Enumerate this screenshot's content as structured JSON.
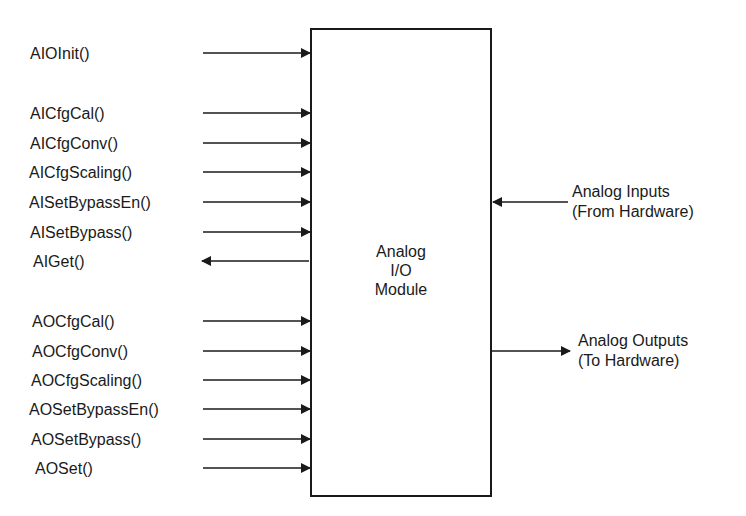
{
  "diagram": {
    "module": {
      "lines": [
        "Analog",
        "I/O",
        "Module"
      ]
    },
    "left_functions": [
      {
        "label": "AIOInit()",
        "direction": "in"
      },
      {
        "label": "AICfgCal()",
        "direction": "in"
      },
      {
        "label": "AICfgConv()",
        "direction": "in"
      },
      {
        "label": "AICfgScaling()",
        "direction": "in"
      },
      {
        "label": "AISetBypassEn()",
        "direction": "in"
      },
      {
        "label": "AISetBypass()",
        "direction": "in"
      },
      {
        "label": "AIGet()",
        "direction": "out"
      },
      {
        "label": "AOCfgCal()",
        "direction": "in"
      },
      {
        "label": "AOCfgConv()",
        "direction": "in"
      },
      {
        "label": "AOCfgScaling()",
        "direction": "in"
      },
      {
        "label": "AOSetBypassEn()",
        "direction": "in"
      },
      {
        "label": "AOSetBypass()",
        "direction": "in"
      },
      {
        "label": "AOSet()",
        "direction": "in"
      }
    ],
    "right_signals": [
      {
        "lines": [
          "Analog Inputs",
          "(From Hardware)"
        ],
        "direction": "in"
      },
      {
        "lines": [
          "Analog Outputs",
          "(To Hardware)"
        ],
        "direction": "out"
      }
    ]
  }
}
